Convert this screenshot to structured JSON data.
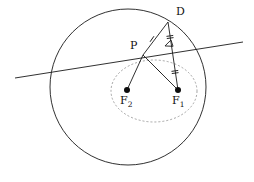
{
  "figure": {
    "background_color": "#ffffff",
    "stroke_color": "#1a1a1a",
    "dashed_color": "#9a9a9a",
    "width": 254,
    "height": 182
  },
  "labels": {
    "point_d": "D",
    "point_p": "P",
    "focus_2_base": "F",
    "focus_2_sub": "2",
    "focus_1_base": "F",
    "focus_1_sub": "1"
  },
  "chart_data": {
    "type": "scatter",
    "xlabel": "",
    "ylabel": "",
    "grid": false,
    "legend": "none",
    "xlim": [
      0,
      254
    ],
    "ylim": [
      182,
      0
    ],
    "shapes": [
      {
        "name": "directrix-circle",
        "kind": "circle",
        "cx": 128,
        "cy": 87,
        "r": 78,
        "stroke": "#1a1a1a",
        "dash": "none",
        "fill": "none"
      },
      {
        "name": "ellipse-locus",
        "kind": "ellipse",
        "cx": 154,
        "cy": 91,
        "rx": 43,
        "ry": 31,
        "stroke": "#9a9a9a",
        "dash": "2 2",
        "fill": "none"
      },
      {
        "name": "tangent-secant-line",
        "kind": "line",
        "x1": 15,
        "y1": 78,
        "x2": 243,
        "y2": 42,
        "stroke": "#1a1a1a",
        "dash": "none"
      },
      {
        "name": "segment-d-f1",
        "kind": "line",
        "x1": 168,
        "y1": 22,
        "x2": 178,
        "y2": 90,
        "stroke": "#1a1a1a",
        "dash": "none"
      },
      {
        "name": "segment-p-d",
        "kind": "line",
        "x1": 143,
        "y1": 55,
        "x2": 168,
        "y2": 22,
        "stroke": "#1a1a1a",
        "dash": "none"
      },
      {
        "name": "segment-p-f1",
        "kind": "line",
        "x1": 143,
        "y1": 55,
        "x2": 178,
        "y2": 90,
        "stroke": "#1a1a1a",
        "dash": "none"
      },
      {
        "name": "segment-p-f2",
        "kind": "line",
        "x1": 143,
        "y1": 55,
        "x2": 127,
        "y2": 90,
        "stroke": "#1a1a1a",
        "dash": "none"
      }
    ],
    "points": [
      {
        "name": "point-d",
        "label": "D",
        "x": 168,
        "y": 22,
        "marker": "none"
      },
      {
        "name": "point-p",
        "label": "P",
        "x": 143,
        "y": 55,
        "marker": "none"
      },
      {
        "name": "focus-2",
        "label": "F2",
        "x": 127,
        "y": 90,
        "marker": "filled-dot",
        "radius": 3
      },
      {
        "name": "focus-1",
        "label": "F1",
        "x": 178,
        "y": 90,
        "marker": "filled-dot",
        "radius": 3
      }
    ],
    "tick_marks": [
      {
        "name": "tick-pd",
        "x": 152,
        "y": 39,
        "count": 1,
        "angle": 35
      },
      {
        "name": "tick-pf1",
        "x": 159,
        "y": 71,
        "count": 1,
        "angle": -45
      },
      {
        "name": "tick-df1-upper",
        "x": 170,
        "y": 37,
        "count": 2,
        "angle": 82
      },
      {
        "name": "tick-df1-lower",
        "x": 175,
        "y": 72,
        "count": 2,
        "angle": 82
      }
    ],
    "right_angle": {
      "name": "right-angle-marker",
      "x": 172,
      "y": 47,
      "size": 7
    },
    "label_positions": [
      {
        "name": "label-d",
        "text": "D",
        "x": 176,
        "y": 6
      },
      {
        "name": "label-p",
        "text": "P",
        "x": 130,
        "y": 40
      },
      {
        "name": "label-f2",
        "text": "F2",
        "x": 120,
        "y": 95
      },
      {
        "name": "label-f1",
        "text": "F1",
        "x": 172,
        "y": 95
      }
    ]
  }
}
